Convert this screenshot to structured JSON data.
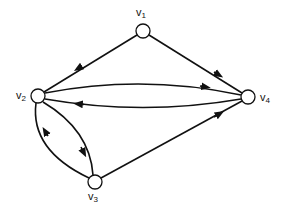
{
  "diagram": {
    "type": "directed-graph",
    "nodes": [
      {
        "id": "v1",
        "label": "v",
        "sub": "1"
      },
      {
        "id": "v2",
        "label": "v",
        "sub": "2"
      },
      {
        "id": "v3",
        "label": "v",
        "sub": "3"
      },
      {
        "id": "v4",
        "label": "v",
        "sub": "4"
      }
    ],
    "edges": [
      {
        "from": "v1",
        "to": "v2"
      },
      {
        "from": "v1",
        "to": "v4"
      },
      {
        "from": "v2",
        "to": "v4"
      },
      {
        "from": "v4",
        "to": "v2"
      },
      {
        "from": "v2",
        "to": "v3"
      },
      {
        "from": "v3",
        "to": "v2"
      },
      {
        "from": "v3",
        "to": "v4"
      }
    ],
    "colors": {
      "stroke": "#111111",
      "background": "#ffffff"
    }
  }
}
